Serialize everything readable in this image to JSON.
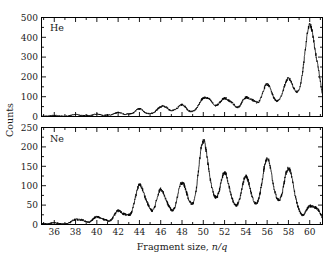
{
  "figure": {
    "background_color": "#ffffff",
    "trace_color": "#000000",
    "axis_color": "#000000"
  },
  "axis_titles": {
    "y_label": "Counts",
    "x_label_prefix": "Fragment size, ",
    "x_label_italic": "n/q"
  },
  "panels": {
    "top": {
      "label": "He"
    },
    "bottom": {
      "label": "Ne"
    }
  },
  "x_tick_labels": [
    "36",
    "38",
    "40",
    "42",
    "44",
    "46",
    "48",
    "50",
    "52",
    "54",
    "56",
    "58",
    "60"
  ],
  "y_tick_labels_top": [
    "0",
    "100",
    "200",
    "300",
    "400",
    "500"
  ],
  "y_tick_labels_bottom": [
    "0",
    "50",
    "100",
    "150",
    "200",
    "250"
  ],
  "chart_data": [
    {
      "type": "line",
      "title": "He",
      "xlabel": "Fragment size, n/q",
      "ylabel": "Counts",
      "xlim": [
        34.8,
        61.2
      ],
      "ylim": [
        0,
        500
      ],
      "xticks": [
        36,
        38,
        40,
        42,
        44,
        46,
        48,
        50,
        52,
        54,
        56,
        58,
        60
      ],
      "yticks": [
        0,
        100,
        200,
        300,
        400,
        500
      ],
      "minor_xtick_step": 1,
      "minor_ytick_step": 50,
      "grid": false,
      "legend": false,
      "annotations": [
        {
          "text": "He",
          "x": 35.6,
          "y": 430
        }
      ],
      "series": [
        {
          "name": "He droplet fragment spectrum",
          "peaks": [
            {
              "center": 36.0,
              "height": 4,
              "width": 0.32
            },
            {
              "center": 38.0,
              "height": 9,
              "width": 0.34
            },
            {
              "center": 39.0,
              "height": 4,
              "width": 0.28
            },
            {
              "center": 40.0,
              "height": 10,
              "width": 0.34
            },
            {
              "center": 41.0,
              "height": 5,
              "width": 0.28
            },
            {
              "center": 42.0,
              "height": 19,
              "width": 0.38
            },
            {
              "center": 43.0,
              "height": 9,
              "width": 0.3
            },
            {
              "center": 44.0,
              "height": 37,
              "width": 0.4
            },
            {
              "center": 45.0,
              "height": 9,
              "width": 0.3
            },
            {
              "center": 46.0,
              "height": 44,
              "width": 0.42
            },
            {
              "center": 46.6,
              "height": 24,
              "width": 0.3
            },
            {
              "center": 47.2,
              "height": 14,
              "width": 0.26
            },
            {
              "center": 48.0,
              "height": 58,
              "width": 0.44
            },
            {
              "center": 49.0,
              "height": 12,
              "width": 0.3
            },
            {
              "center": 50.0,
              "height": 86,
              "width": 0.46
            },
            {
              "center": 50.7,
              "height": 48,
              "width": 0.32
            },
            {
              "center": 51.3,
              "height": 18,
              "width": 0.28
            },
            {
              "center": 52.0,
              "height": 88,
              "width": 0.46
            },
            {
              "center": 52.8,
              "height": 40,
              "width": 0.32
            },
            {
              "center": 54.0,
              "height": 92,
              "width": 0.48
            },
            {
              "center": 54.8,
              "height": 42,
              "width": 0.32
            },
            {
              "center": 56.0,
              "height": 160,
              "width": 0.52
            },
            {
              "center": 57.0,
              "height": 18,
              "width": 0.3
            },
            {
              "center": 58.0,
              "height": 188,
              "width": 0.54
            },
            {
              "center": 59.0,
              "height": 40,
              "width": 0.36
            },
            {
              "center": 60.0,
              "height": 455,
              "width": 0.5
            },
            {
              "center": 60.9,
              "height": 120,
              "width": 0.34
            }
          ],
          "baseline": 2,
          "noise_amplitude": 3
        }
      ]
    },
    {
      "type": "line",
      "title": "Ne",
      "xlabel": "Fragment size, n/q",
      "ylabel": "Counts",
      "xlim": [
        34.8,
        61.2
      ],
      "ylim": [
        0,
        250
      ],
      "xticks": [
        36,
        38,
        40,
        42,
        44,
        46,
        48,
        50,
        52,
        54,
        56,
        58,
        60
      ],
      "yticks": [
        0,
        50,
        100,
        150,
        200,
        250
      ],
      "minor_xtick_step": 1,
      "minor_ytick_step": 25,
      "grid": false,
      "legend": false,
      "annotations": [
        {
          "text": "Ne",
          "x": 35.6,
          "y": 212
        }
      ],
      "series": [
        {
          "name": "Ne droplet fragment spectrum",
          "peaks": [
            {
              "center": 36.0,
              "height": 3,
              "width": 0.3
            },
            {
              "center": 38.0,
              "height": 11,
              "width": 0.36
            },
            {
              "center": 38.7,
              "height": 8,
              "width": 0.3
            },
            {
              "center": 40.0,
              "height": 18,
              "width": 0.4
            },
            {
              "center": 40.8,
              "height": 8,
              "width": 0.3
            },
            {
              "center": 42.0,
              "height": 33,
              "width": 0.4
            },
            {
              "center": 42.8,
              "height": 17,
              "width": 0.32
            },
            {
              "center": 44.0,
              "height": 98,
              "width": 0.44
            },
            {
              "center": 44.8,
              "height": 30,
              "width": 0.34
            },
            {
              "center": 46.0,
              "height": 88,
              "width": 0.44
            },
            {
              "center": 46.8,
              "height": 24,
              "width": 0.32
            },
            {
              "center": 48.0,
              "height": 106,
              "width": 0.46
            },
            {
              "center": 48.8,
              "height": 22,
              "width": 0.32
            },
            {
              "center": 50.0,
              "height": 213,
              "width": 0.48
            },
            {
              "center": 50.9,
              "height": 38,
              "width": 0.34
            },
            {
              "center": 52.0,
              "height": 131,
              "width": 0.48
            },
            {
              "center": 52.9,
              "height": 22,
              "width": 0.32
            },
            {
              "center": 54.0,
              "height": 121,
              "width": 0.48
            },
            {
              "center": 54.9,
              "height": 18,
              "width": 0.32
            },
            {
              "center": 56.0,
              "height": 168,
              "width": 0.5
            },
            {
              "center": 56.9,
              "height": 22,
              "width": 0.32
            },
            {
              "center": 58.0,
              "height": 143,
              "width": 0.5
            },
            {
              "center": 58.9,
              "height": 14,
              "width": 0.3
            },
            {
              "center": 60.0,
              "height": 44,
              "width": 0.44
            },
            {
              "center": 60.8,
              "height": 28,
              "width": 0.34
            }
          ],
          "baseline": 1.5,
          "noise_amplitude": 2.5
        }
      ]
    }
  ]
}
